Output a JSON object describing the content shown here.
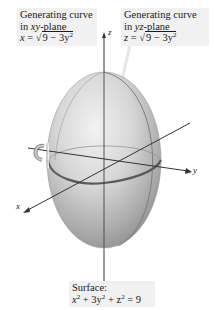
{
  "figure": {
    "type": "surface-of-revolution diagram",
    "background": "#ffffff",
    "surface_fill_light": "#efefef",
    "surface_fill_dark": "#8f8f8f",
    "axis_color": "#333333"
  },
  "annotations": {
    "xy_curve": {
      "line1": "Generating curve",
      "line2_prefix": "in ",
      "line2_var": "xy",
      "line2_suffix": "-plane",
      "eq_lhs": "x",
      "eq_eq": " = ",
      "eq_radicand": "9 − 3y",
      "eq_exp": "2"
    },
    "yz_curve": {
      "line1": "Generating curve",
      "line2_prefix": "in ",
      "line2_var": "yz",
      "line2_suffix": "-plane",
      "eq_lhs": "z",
      "eq_eq": " = ",
      "eq_radicand": "9 − 3y",
      "eq_exp": "2"
    },
    "surface": {
      "line1": "Surface:",
      "eq_part1": "x",
      "eq_exp1": "2",
      "eq_part2": " + 3y",
      "eq_exp2": "2",
      "eq_part3": " + z",
      "eq_exp3": "2",
      "eq_part4": " = 9"
    }
  },
  "axes": {
    "x": "x",
    "y": "y",
    "z": "z"
  }
}
